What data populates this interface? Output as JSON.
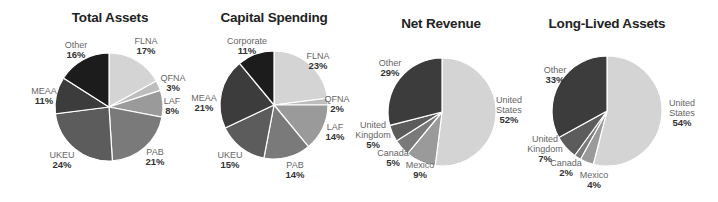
{
  "chart_data": [
    {
      "type": "pie",
      "title": "Total Assets",
      "center": [
        109,
        107
      ],
      "radius": 54,
      "slices": [
        {
          "label": "FLNA",
          "value": 17,
          "color": "#d4d4d4",
          "lx": 146,
          "ly": 36
        },
        {
          "label": "QFNA",
          "value": 3,
          "color": "#bdbdbd",
          "lx": 173,
          "ly": 73
        },
        {
          "label": "LAF",
          "value": 8,
          "color": "#9a9a9a",
          "lx": 172,
          "ly": 96
        },
        {
          "label": "PAB",
          "value": 21,
          "color": "#7a7a7a",
          "lx": 155,
          "ly": 147
        },
        {
          "label": "UKEU",
          "value": 24,
          "color": "#5c5c5c",
          "lx": 62,
          "ly": 150
        },
        {
          "label": "MEAA",
          "value": 11,
          "color": "#3c3c3c",
          "lx": 44,
          "ly": 86
        },
        {
          "label": "Other",
          "value": 16,
          "color": "#1c1c1c",
          "lx": 76,
          "ly": 40
        }
      ]
    },
    {
      "type": "pie",
      "title": "Capital Spending",
      "center": [
        274,
        105
      ],
      "radius": 54,
      "slices": [
        {
          "label": "FLNA",
          "value": 23,
          "color": "#d4d4d4",
          "lx": 318,
          "ly": 51
        },
        {
          "label": "QFNA",
          "value": 2,
          "color": "#bdbdbd",
          "lx": 337,
          "ly": 94
        },
        {
          "label": "LAF",
          "value": 14,
          "color": "#9a9a9a",
          "lx": 335,
          "ly": 122
        },
        {
          "label": "PAB",
          "value": 14,
          "color": "#7a7a7a",
          "lx": 295,
          "ly": 160
        },
        {
          "label": "UKEU",
          "value": 15,
          "color": "#5c5c5c",
          "lx": 230,
          "ly": 150
        },
        {
          "label": "MEAA",
          "value": 21,
          "color": "#3c3c3c",
          "lx": 204,
          "ly": 93
        },
        {
          "label": "Corporate",
          "value": 11,
          "color": "#1c1c1c",
          "lx": 247,
          "ly": 36
        }
      ]
    },
    {
      "type": "pie",
      "title": "Net Revenue",
      "center": [
        442,
        112
      ],
      "radius": 54,
      "slices": [
        {
          "label": "United States",
          "value": 52,
          "color": "#d4d4d4",
          "lx": 509,
          "ly": 95
        },
        {
          "label": "Mexico",
          "value": 9,
          "color": "#9a9a9a",
          "lx": 420,
          "ly": 160
        },
        {
          "label": "Canada",
          "value": 5,
          "color": "#7a7a7a",
          "lx": 393,
          "ly": 148
        },
        {
          "label": "United Kingdom",
          "value": 5,
          "color": "#5c5c5c",
          "lx": 373,
          "ly": 120
        },
        {
          "label": "Other",
          "value": 29,
          "color": "#3c3c3c",
          "lx": 390,
          "ly": 58
        }
      ]
    },
    {
      "type": "pie",
      "title": "Long-Lived Assets",
      "center": [
        607,
        111
      ],
      "radius": 55,
      "slices": [
        {
          "label": "United States",
          "value": 54,
          "color": "#d4d4d4",
          "lx": 682,
          "ly": 98
        },
        {
          "label": "Mexico",
          "value": 4,
          "color": "#9a9a9a",
          "lx": 594,
          "ly": 170
        },
        {
          "label": "Canada",
          "value": 2,
          "color": "#7a7a7a",
          "lx": 566,
          "ly": 158
        },
        {
          "label": "United Kingdom",
          "value": 7,
          "color": "#5c5c5c",
          "lx": 545,
          "ly": 134
        },
        {
          "label": "Other",
          "value": 33,
          "color": "#3c3c3c",
          "lx": 555,
          "ly": 65
        }
      ]
    }
  ],
  "titles": {
    "c0": {
      "text": "Total Assets",
      "x": 110,
      "y": 10
    },
    "c1": {
      "text": "Capital Spending",
      "x": 274,
      "y": 10
    },
    "c2": {
      "text": "Net Revenue",
      "x": 441,
      "y": 16
    },
    "c3": {
      "text": "Long-Lived Assets",
      "x": 607,
      "y": 16
    }
  }
}
